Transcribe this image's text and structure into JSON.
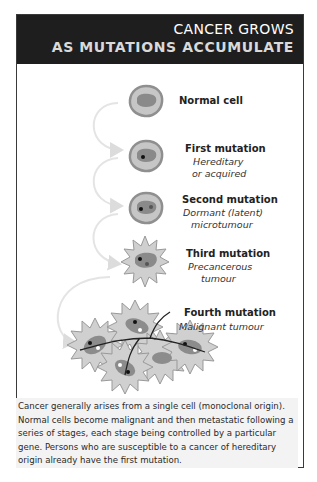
{
  "header": {
    "title_line1": "CANCER GROWS",
    "title_line2": "AS MUTATIONS ACCUMULATE"
  },
  "stages": [
    {
      "label": "Normal cell",
      "sub1": "",
      "sub2": ""
    },
    {
      "label": "First mutation",
      "sub1": "Hereditary",
      "sub2": "or acquired"
    },
    {
      "label": "Second mutation",
      "sub1": "Dormant (latent)",
      "sub2": "microtumour"
    },
    {
      "label": "Third mutation",
      "sub1": "Precancerous",
      "sub2": "tumour"
    },
    {
      "label": "Fourth mutation",
      "sub1": "Malignant tumour",
      "sub2": ""
    }
  ],
  "caption": {
    "text": "Cancer generally arises from a single cell (monoclonal origin). Normal cells become malignant and then metastatic following a series of stages, each stage being controlled by a particular gene. Persons who are susceptible to a cancer of hereditary origin already have the first mutation."
  },
  "colors": {
    "header_bg": "#1e1e1e",
    "cell_outer": "#b0b0b0",
    "cell_ring": "#8a8a8a",
    "nucleus": "#7a7a7a",
    "arrow": "#e2e2e2"
  }
}
